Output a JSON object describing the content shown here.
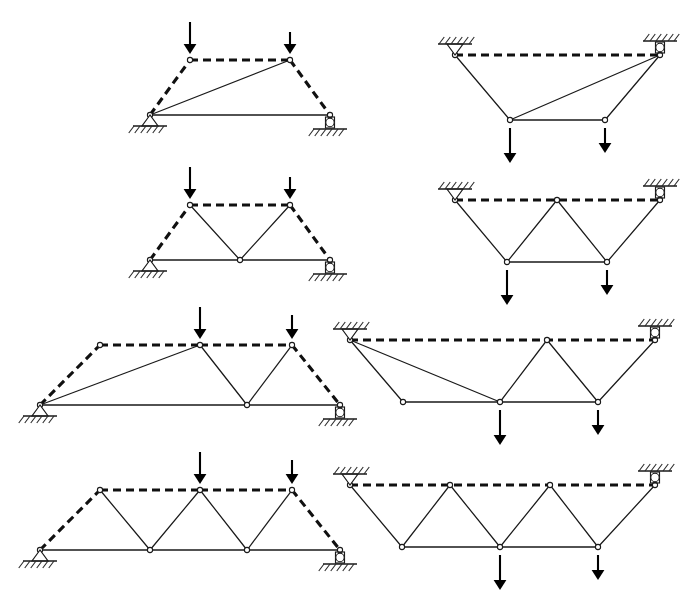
{
  "figure": {
    "columns": 2,
    "rows": 4,
    "stroke_color": "#1a1a1a",
    "background_color": "#ffffff",
    "load_color": "#000000"
  },
  "legend": {
    "solid_member_label": "solid member",
    "dashed_member_label": "dashed member",
    "pin_support_label": "pin support",
    "roller_support_label": "roller support",
    "load_label": "point load"
  },
  "panels": [
    {
      "id": "panel-1",
      "name": "truss-row1-left",
      "orientation": "upright",
      "row": 1,
      "column": "left",
      "origin": [
        150,
        60
      ],
      "span": 180,
      "height": 55,
      "top_nodes": [
        [
          40,
          0
        ],
        [
          140,
          0
        ]
      ],
      "bottom_nodes": [
        [
          0,
          55
        ],
        [
          180,
          55
        ]
      ],
      "dashed_members": [
        [
          [
            0,
            55
          ],
          [
            40,
            0
          ]
        ],
        [
          [
            40,
            0
          ],
          [
            140,
            0
          ]
        ],
        [
          [
            140,
            0
          ],
          [
            180,
            55
          ]
        ]
      ],
      "solid_members": [
        [
          [
            0,
            55
          ],
          [
            180,
            55
          ]
        ],
        [
          [
            0,
            55
          ],
          [
            140,
            0
          ]
        ]
      ],
      "joints": [
        [
          0,
          55
        ],
        [
          40,
          0
        ],
        [
          140,
          0
        ],
        [
          180,
          55
        ]
      ],
      "loads": [
        {
          "at": [
            40,
            0
          ],
          "direction": "down",
          "length": 32
        },
        {
          "at": [
            140,
            0
          ],
          "direction": "down",
          "length": 22
        }
      ],
      "supports": [
        {
          "type": "pin",
          "at": [
            0,
            55
          ]
        },
        {
          "type": "roller",
          "at": [
            180,
            55
          ]
        }
      ]
    },
    {
      "id": "panel-2",
      "name": "truss-row1-right",
      "orientation": "inverted",
      "row": 1,
      "column": "right",
      "origin": [
        455,
        55
      ],
      "span": 205,
      "height": 65,
      "top_nodes": [
        [
          0,
          0
        ],
        [
          205,
          0
        ]
      ],
      "bottom_nodes": [
        [
          55,
          65
        ],
        [
          150,
          65
        ]
      ],
      "dashed_members": [
        [
          [
            0,
            0
          ],
          [
            205,
            0
          ]
        ]
      ],
      "solid_members": [
        [
          [
            0,
            0
          ],
          [
            55,
            65
          ]
        ],
        [
          [
            55,
            65
          ],
          [
            150,
            65
          ]
        ],
        [
          [
            150,
            65
          ],
          [
            205,
            0
          ]
        ],
        [
          [
            55,
            65
          ],
          [
            205,
            0
          ]
        ]
      ],
      "joints": [
        [
          0,
          0
        ],
        [
          205,
          0
        ],
        [
          55,
          65
        ],
        [
          150,
          65
        ]
      ],
      "loads": [
        {
          "at": [
            55,
            65
          ],
          "direction": "down",
          "length": 35
        },
        {
          "at": [
            150,
            65
          ],
          "direction": "down",
          "length": 25
        }
      ],
      "supports": [
        {
          "type": "pin",
          "at": [
            0,
            0
          ]
        },
        {
          "type": "roller",
          "at": [
            205,
            0
          ]
        }
      ]
    },
    {
      "id": "panel-3",
      "name": "truss-row2-left",
      "orientation": "upright",
      "row": 2,
      "column": "left",
      "origin": [
        150,
        205
      ],
      "span": 180,
      "height": 55,
      "top_nodes": [
        [
          40,
          0
        ],
        [
          140,
          0
        ]
      ],
      "bottom_nodes": [
        [
          0,
          55
        ],
        [
          90,
          55
        ],
        [
          180,
          55
        ]
      ],
      "dashed_members": [
        [
          [
            0,
            55
          ],
          [
            40,
            0
          ]
        ],
        [
          [
            40,
            0
          ],
          [
            140,
            0
          ]
        ],
        [
          [
            140,
            0
          ],
          [
            180,
            55
          ]
        ]
      ],
      "solid_members": [
        [
          [
            0,
            55
          ],
          [
            180,
            55
          ]
        ],
        [
          [
            40,
            0
          ],
          [
            90,
            55
          ]
        ],
        [
          [
            90,
            55
          ],
          [
            140,
            0
          ]
        ]
      ],
      "joints": [
        [
          0,
          55
        ],
        [
          40,
          0
        ],
        [
          90,
          55
        ],
        [
          140,
          0
        ],
        [
          180,
          55
        ]
      ],
      "loads": [
        {
          "at": [
            40,
            0
          ],
          "direction": "down",
          "length": 32
        },
        {
          "at": [
            140,
            0
          ],
          "direction": "down",
          "length": 22
        }
      ],
      "supports": [
        {
          "type": "pin",
          "at": [
            0,
            55
          ]
        },
        {
          "type": "roller",
          "at": [
            180,
            55
          ]
        }
      ]
    },
    {
      "id": "panel-4",
      "name": "truss-row2-right",
      "orientation": "inverted",
      "row": 2,
      "column": "right",
      "origin": [
        455,
        200
      ],
      "span": 205,
      "height": 62,
      "top_nodes": [
        [
          0,
          0
        ],
        [
          102,
          0
        ],
        [
          205,
          0
        ]
      ],
      "bottom_nodes": [
        [
          52,
          62
        ],
        [
          152,
          62
        ]
      ],
      "dashed_members": [
        [
          [
            0,
            0
          ],
          [
            205,
            0
          ]
        ]
      ],
      "solid_members": [
        [
          [
            0,
            0
          ],
          [
            52,
            62
          ]
        ],
        [
          [
            52,
            62
          ],
          [
            102,
            0
          ]
        ],
        [
          [
            102,
            0
          ],
          [
            152,
            62
          ]
        ],
        [
          [
            152,
            62
          ],
          [
            205,
            0
          ]
        ],
        [
          [
            52,
            62
          ],
          [
            152,
            62
          ]
        ]
      ],
      "joints": [
        [
          0,
          0
        ],
        [
          102,
          0
        ],
        [
          205,
          0
        ],
        [
          52,
          62
        ],
        [
          152,
          62
        ]
      ],
      "loads": [
        {
          "at": [
            52,
            62
          ],
          "direction": "down",
          "length": 35
        },
        {
          "at": [
            152,
            62
          ],
          "direction": "down",
          "length": 25
        }
      ],
      "supports": [
        {
          "type": "pin",
          "at": [
            0,
            0
          ]
        },
        {
          "type": "roller",
          "at": [
            205,
            0
          ]
        }
      ]
    },
    {
      "id": "panel-5",
      "name": "truss-row3-left",
      "orientation": "upright",
      "row": 3,
      "column": "left",
      "origin": [
        40,
        345
      ],
      "span": 300,
      "height": 60,
      "top_nodes": [
        [
          60,
          0
        ],
        [
          160,
          0
        ],
        [
          252,
          0
        ]
      ],
      "bottom_nodes": [
        [
          0,
          60
        ],
        [
          207,
          60
        ],
        [
          300,
          60
        ]
      ],
      "dashed_members": [
        [
          [
            0,
            60
          ],
          [
            60,
            0
          ]
        ],
        [
          [
            60,
            0
          ],
          [
            160,
            0
          ]
        ],
        [
          [
            160,
            0
          ],
          [
            252,
            0
          ]
        ],
        [
          [
            252,
            0
          ],
          [
            300,
            60
          ]
        ]
      ],
      "solid_members": [
        [
          [
            0,
            60
          ],
          [
            300,
            60
          ]
        ],
        [
          [
            0,
            60
          ],
          [
            160,
            0
          ]
        ],
        [
          [
            160,
            0
          ],
          [
            207,
            60
          ]
        ],
        [
          [
            207,
            60
          ],
          [
            252,
            0
          ]
        ]
      ],
      "joints": [
        [
          0,
          60
        ],
        [
          60,
          0
        ],
        [
          160,
          0
        ],
        [
          207,
          60
        ],
        [
          252,
          0
        ],
        [
          300,
          60
        ]
      ],
      "loads": [
        {
          "at": [
            160,
            0
          ],
          "direction": "down",
          "length": 32
        },
        {
          "at": [
            252,
            0
          ],
          "direction": "down",
          "length": 24
        }
      ],
      "supports": [
        {
          "type": "pin",
          "at": [
            0,
            60
          ]
        },
        {
          "type": "roller",
          "at": [
            300,
            60
          ]
        }
      ]
    },
    {
      "id": "panel-6",
      "name": "truss-row3-right",
      "orientation": "inverted",
      "row": 3,
      "column": "right",
      "origin": [
        350,
        340
      ],
      "span": 305,
      "height": 62,
      "top_nodes": [
        [
          0,
          0
        ],
        [
          197,
          0
        ],
        [
          305,
          0
        ]
      ],
      "bottom_nodes": [
        [
          53,
          62
        ],
        [
          150,
          62
        ],
        [
          248,
          62
        ]
      ],
      "dashed_members": [
        [
          [
            0,
            0
          ],
          [
            305,
            0
          ]
        ]
      ],
      "solid_members": [
        [
          [
            0,
            0
          ],
          [
            53,
            62
          ]
        ],
        [
          [
            53,
            62
          ],
          [
            150,
            62
          ]
        ],
        [
          [
            150,
            62
          ],
          [
            248,
            62
          ]
        ],
        [
          [
            0,
            0
          ],
          [
            150,
            62
          ]
        ],
        [
          [
            150,
            62
          ],
          [
            197,
            0
          ]
        ],
        [
          [
            197,
            0
          ],
          [
            248,
            62
          ]
        ],
        [
          [
            248,
            62
          ],
          [
            305,
            0
          ]
        ]
      ],
      "joints": [
        [
          0,
          0
        ],
        [
          197,
          0
        ],
        [
          305,
          0
        ],
        [
          53,
          62
        ],
        [
          150,
          62
        ],
        [
          248,
          62
        ]
      ],
      "loads": [
        {
          "at": [
            150,
            62
          ],
          "direction": "down",
          "length": 35
        },
        {
          "at": [
            248,
            62
          ],
          "direction": "down",
          "length": 25
        }
      ],
      "supports": [
        {
          "type": "pin",
          "at": [
            0,
            0
          ]
        },
        {
          "type": "roller",
          "at": [
            305,
            0
          ]
        }
      ]
    },
    {
      "id": "panel-7",
      "name": "truss-row4-left",
      "orientation": "upright",
      "row": 4,
      "column": "left",
      "origin": [
        40,
        490
      ],
      "span": 300,
      "height": 60,
      "top_nodes": [
        [
          60,
          0
        ],
        [
          160,
          0
        ],
        [
          252,
          0
        ]
      ],
      "bottom_nodes": [
        [
          0,
          60
        ],
        [
          110,
          60
        ],
        [
          207,
          60
        ],
        [
          300,
          60
        ]
      ],
      "dashed_members": [
        [
          [
            0,
            60
          ],
          [
            60,
            0
          ]
        ],
        [
          [
            60,
            0
          ],
          [
            160,
            0
          ]
        ],
        [
          [
            160,
            0
          ],
          [
            252,
            0
          ]
        ],
        [
          [
            252,
            0
          ],
          [
            300,
            60
          ]
        ]
      ],
      "solid_members": [
        [
          [
            0,
            60
          ],
          [
            300,
            60
          ]
        ],
        [
          [
            60,
            0
          ],
          [
            110,
            60
          ]
        ],
        [
          [
            110,
            60
          ],
          [
            160,
            0
          ]
        ],
        [
          [
            160,
            0
          ],
          [
            207,
            60
          ]
        ],
        [
          [
            207,
            60
          ],
          [
            252,
            0
          ]
        ]
      ],
      "joints": [
        [
          0,
          60
        ],
        [
          60,
          0
        ],
        [
          110,
          60
        ],
        [
          160,
          0
        ],
        [
          207,
          60
        ],
        [
          252,
          0
        ],
        [
          300,
          60
        ]
      ],
      "loads": [
        {
          "at": [
            160,
            0
          ],
          "direction": "down",
          "length": 32
        },
        {
          "at": [
            252,
            0
          ],
          "direction": "down",
          "length": 24
        }
      ],
      "supports": [
        {
          "type": "pin",
          "at": [
            0,
            60
          ]
        },
        {
          "type": "roller",
          "at": [
            300,
            60
          ]
        }
      ]
    },
    {
      "id": "panel-8",
      "name": "truss-row4-right",
      "orientation": "inverted",
      "row": 4,
      "column": "right",
      "origin": [
        350,
        485
      ],
      "span": 305,
      "height": 62,
      "top_nodes": [
        [
          0,
          0
        ],
        [
          100,
          0
        ],
        [
          200,
          0
        ],
        [
          305,
          0
        ]
      ],
      "bottom_nodes": [
        [
          52,
          62
        ],
        [
          150,
          62
        ],
        [
          248,
          62
        ]
      ],
      "dashed_members": [
        [
          [
            0,
            0
          ],
          [
            305,
            0
          ]
        ]
      ],
      "solid_members": [
        [
          [
            0,
            0
          ],
          [
            52,
            62
          ]
        ],
        [
          [
            52,
            62
          ],
          [
            100,
            0
          ]
        ],
        [
          [
            100,
            0
          ],
          [
            150,
            62
          ]
        ],
        [
          [
            150,
            62
          ],
          [
            200,
            0
          ]
        ],
        [
          [
            200,
            0
          ],
          [
            248,
            62
          ]
        ],
        [
          [
            248,
            62
          ],
          [
            305,
            0
          ]
        ],
        [
          [
            52,
            62
          ],
          [
            248,
            62
          ]
        ]
      ],
      "joints": [
        [
          0,
          0
        ],
        [
          100,
          0
        ],
        [
          200,
          0
        ],
        [
          305,
          0
        ],
        [
          52,
          62
        ],
        [
          150,
          62
        ],
        [
          248,
          62
        ]
      ],
      "loads": [
        {
          "at": [
            150,
            62
          ],
          "direction": "down",
          "length": 35
        },
        {
          "at": [
            248,
            62
          ],
          "direction": "down",
          "length": 25
        }
      ],
      "supports": [
        {
          "type": "pin",
          "at": [
            0,
            0
          ]
        },
        {
          "type": "roller",
          "at": [
            305,
            0
          ]
        }
      ]
    }
  ]
}
